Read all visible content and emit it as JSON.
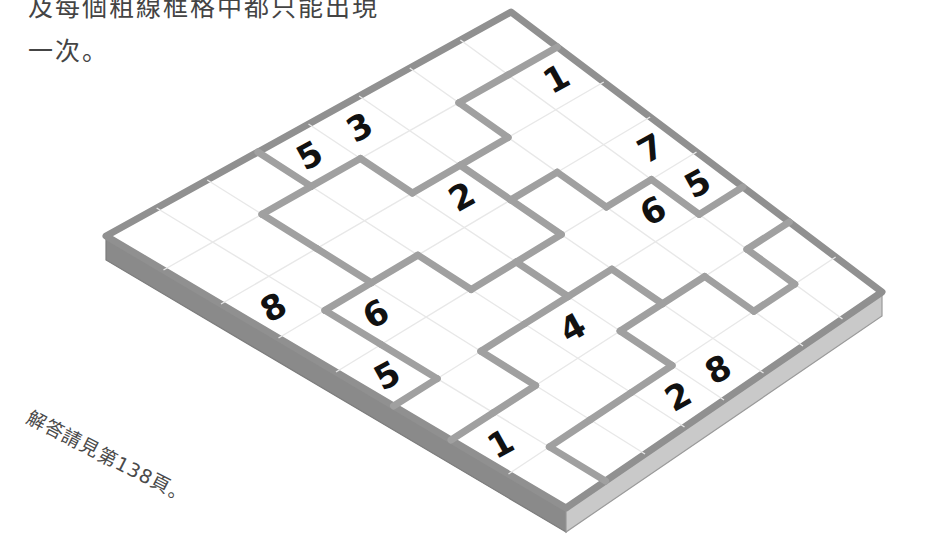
{
  "page": {
    "intro_text": "及每個粗線框格中都只能出現\n一次。",
    "answer_note": "解答請見第138頁。"
  },
  "colors": {
    "paper": "#ffffff",
    "board_top": "#ffffff",
    "board_side_left": "#8a8a8a",
    "board_side_right": "#c9c9c9",
    "board_outline": "#909090",
    "region_line": "#a0a0a0",
    "cell_line": "#ffffff",
    "digit": "#111111",
    "text": "#444444"
  },
  "puzzle": {
    "type": "jigsaw-sudoku",
    "grid_size": 8,
    "projection": "isometric-3d-slab",
    "corners": {
      "top": [
        511,
        12
      ],
      "right": [
        882,
        292
      ],
      "bottom": [
        566,
        508
      ],
      "left": [
        106,
        236
      ]
    },
    "slab_thickness": 24,
    "givens": [
      {
        "row": 0,
        "col": 3,
        "value": "5"
      },
      {
        "row": 0,
        "col": 4,
        "value": "3"
      },
      {
        "row": 1,
        "col": 7,
        "value": "1"
      },
      {
        "row": 2,
        "col": 0,
        "value": "8"
      },
      {
        "row": 2,
        "col": 4,
        "value": "2"
      },
      {
        "row": 3,
        "col": 1,
        "value": "6"
      },
      {
        "row": 3,
        "col": 7,
        "value": "7"
      },
      {
        "row": 4,
        "col": 0,
        "value": "5"
      },
      {
        "row": 4,
        "col": 6,
        "value": "6"
      },
      {
        "row": 4,
        "col": 7,
        "value": "5"
      },
      {
        "row": 5,
        "col": 3,
        "value": "4"
      },
      {
        "row": 6,
        "col": 0,
        "value": "1"
      },
      {
        "row": 7,
        "col": 4,
        "value": "8"
      },
      {
        "row": 7,
        "col": 3,
        "value": "2"
      }
    ],
    "region_map": [
      [
        0,
        0,
        0,
        1,
        1,
        1,
        1,
        1
      ],
      [
        0,
        0,
        2,
        2,
        1,
        1,
        3,
        3
      ],
      [
        0,
        0,
        2,
        2,
        2,
        3,
        3,
        3
      ],
      [
        0,
        4,
        4,
        2,
        2,
        5,
        3,
        3
      ],
      [
        0,
        4,
        4,
        4,
        5,
        5,
        5,
        3
      ],
      [
        4,
        4,
        6,
        6,
        6,
        5,
        5,
        5
      ],
      [
        6,
        6,
        6,
        6,
        7,
        7,
        5,
        7
      ],
      [
        6,
        7,
        7,
        7,
        7,
        7,
        7,
        7
      ]
    ],
    "region_count": 8
  }
}
